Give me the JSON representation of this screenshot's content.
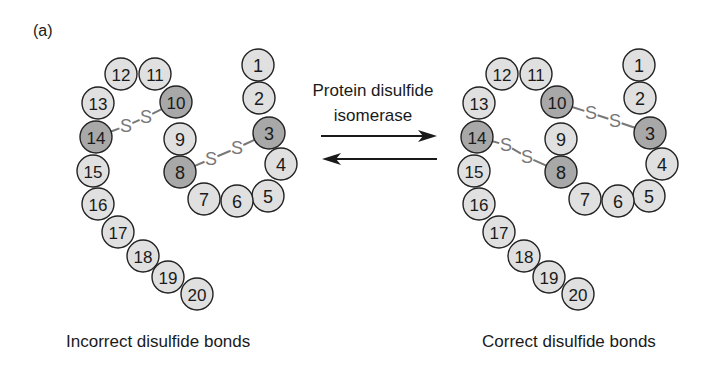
{
  "panel_label": "(a)",
  "enzyme": {
    "line1": "Protein disulfide",
    "line2": "isomerase"
  },
  "captions": {
    "left": "Incorrect disulfide bonds",
    "right": "Correct disulfide bonds"
  },
  "colors": {
    "residue_fill": "#e0e0e0",
    "cysteine_fill": "#a8a8a8",
    "outline": "#222222",
    "bond": "#777777",
    "arrow": "#1a1a1a"
  },
  "residue_radius": 16,
  "residues": [
    {
      "n": "1",
      "x": 258,
      "y": 65,
      "cys": false
    },
    {
      "n": "2",
      "x": 259,
      "y": 98,
      "cys": false
    },
    {
      "n": "3",
      "x": 269,
      "y": 133,
      "cys": true
    },
    {
      "n": "4",
      "x": 281,
      "y": 164,
      "cys": false
    },
    {
      "n": "5",
      "x": 268,
      "y": 196,
      "cys": false
    },
    {
      "n": "6",
      "x": 237,
      "y": 201,
      "cys": false
    },
    {
      "n": "7",
      "x": 204,
      "y": 199,
      "cys": false
    },
    {
      "n": "8",
      "x": 180,
      "y": 172,
      "cys": true
    },
    {
      "n": "9",
      "x": 180,
      "y": 139,
      "cys": false
    },
    {
      "n": "10",
      "x": 176,
      "y": 102,
      "cys": true
    },
    {
      "n": "11",
      "x": 155,
      "y": 74,
      "cys": false
    },
    {
      "n": "12",
      "x": 121,
      "y": 74,
      "cys": false
    },
    {
      "n": "13",
      "x": 98,
      "y": 103,
      "cys": false
    },
    {
      "n": "14",
      "x": 96,
      "y": 137,
      "cys": true
    },
    {
      "n": "15",
      "x": 93,
      "y": 171,
      "cys": false
    },
    {
      "n": "16",
      "x": 98,
      "y": 204,
      "cys": false
    },
    {
      "n": "17",
      "x": 118,
      "y": 232,
      "cys": false
    },
    {
      "n": "18",
      "x": 143,
      "y": 256,
      "cys": false
    },
    {
      "n": "19",
      "x": 168,
      "y": 277,
      "cys": false
    },
    {
      "n": "20",
      "x": 197,
      "y": 294,
      "cys": false
    }
  ],
  "structures": [
    {
      "name": "incorrect",
      "offset_x": 0,
      "bonds": [
        {
          "from": "14",
          "to": "10",
          "s1": [
            126,
            126
          ],
          "s2": [
            146,
            117
          ]
        },
        {
          "from": "8",
          "to": "3",
          "s1": [
            211,
            159
          ],
          "s2": [
            237,
            148
          ]
        }
      ]
    },
    {
      "name": "correct",
      "offset_x": 381,
      "bonds": [
        {
          "from": "14",
          "to": "8",
          "s1": [
            506,
            145
          ],
          "s2": [
            527,
            157
          ]
        },
        {
          "from": "10",
          "to": "3",
          "s1": [
            591,
            113
          ],
          "s2": [
            615,
            121
          ]
        }
      ]
    }
  ],
  "bond_symbol": "S",
  "arrows": {
    "forward": {
      "x1": 321,
      "x2": 437,
      "y": 136
    },
    "reverse": {
      "x1": 322,
      "x2": 437,
      "y": 159
    }
  }
}
